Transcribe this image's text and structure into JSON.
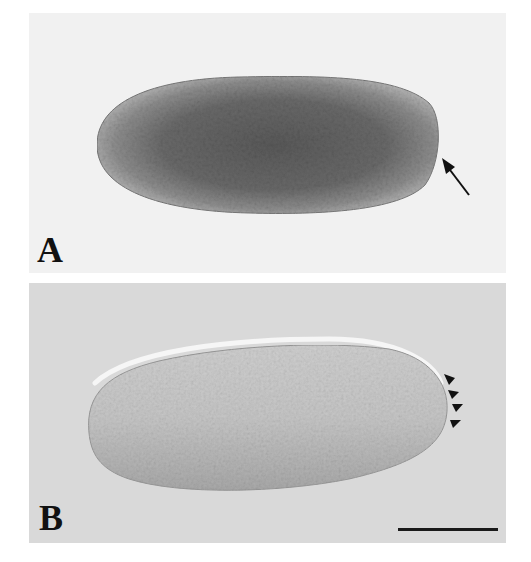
{
  "figure": {
    "panels": [
      {
        "id": "A",
        "label": "A",
        "description": "Elongated ovoid embryo, darkly stained interior with lighter periphery; arrow points at posterior (right) pole",
        "background_color": "#f1f1f1",
        "annotation": {
          "type": "arrow",
          "count": 1
        }
      },
      {
        "id": "B",
        "label": "B",
        "description": "Elongated ovoid embryo, unstained granular grey interior with bright halo on upper edge; arrowheads mark posterior pole",
        "background_color": "#d9d9d9",
        "annotation": {
          "type": "arrowheads",
          "count": 4
        }
      }
    ],
    "scale_bar": {
      "visible": true,
      "color": "#1a1a1a"
    }
  }
}
